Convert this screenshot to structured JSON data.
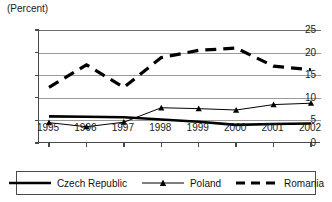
{
  "chart_data": {
    "type": "line",
    "title": "(Percent)",
    "xlabel": "",
    "ylabel": "",
    "categories": [
      "1995",
      "1996",
      "1997",
      "1998",
      "1999",
      "2000",
      "2001",
      "2002"
    ],
    "ylim": [
      0,
      25
    ],
    "yticks": [
      0,
      5,
      10,
      15,
      20,
      25
    ],
    "grid": true,
    "legend_position": "bottom",
    "series": [
      {
        "name": "Czech Republic",
        "style": "thick-solid",
        "color": "#000000",
        "marker": "none",
        "values": [
          5.9,
          5.8,
          5.7,
          5.2,
          4.7,
          4.0,
          4.2,
          4.3
        ]
      },
      {
        "name": "Poland",
        "style": "thin-solid",
        "color": "#000000",
        "marker": "triangle",
        "values": [
          4.5,
          3.6,
          4.6,
          7.8,
          7.6,
          7.3,
          8.5,
          8.8
        ]
      },
      {
        "name": "Romania",
        "style": "thick-dashed",
        "color": "#000000",
        "marker": "none",
        "values": [
          12.3,
          17.3,
          12.3,
          18.9,
          20.5,
          21.0,
          17.0,
          16.2
        ]
      }
    ]
  },
  "axis": {
    "y_labels": [
      "25",
      "20",
      "15",
      "10",
      "5",
      "0"
    ],
    "x_labels": [
      "1995",
      "1996",
      "1997",
      "1998",
      "1999",
      "2000",
      "2001",
      "2002"
    ],
    "units_label": "(Percent)"
  },
  "legend": {
    "items": [
      {
        "label": "Czech Republic",
        "swatch": "thick-solid-line"
      },
      {
        "label": "Poland",
        "swatch": "thin-line-triangle-marker"
      },
      {
        "label": "Romania",
        "swatch": "thick-dashed-line"
      }
    ]
  }
}
